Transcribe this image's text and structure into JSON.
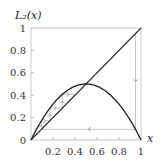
{
  "chart_data": {
    "type": "line",
    "title": "",
    "ylabel": "L2(x)",
    "ylabel_display": "L₂(x)",
    "xlabel": "x",
    "xlim": [
      0,
      1
    ],
    "ylim": [
      0,
      1
    ],
    "grid": false,
    "legend": null,
    "xticks": [
      0.2,
      0.4,
      0.6,
      0.8,
      1
    ],
    "xtick_labels": [
      "0.2",
      "0.4",
      "0.6",
      "0.8",
      "1"
    ],
    "yticks": [
      0,
      0.2,
      0.4,
      0.6,
      0.8,
      1
    ],
    "ytick_labels": [
      "0",
      "0.2",
      "0.4",
      "0.6",
      "0.8",
      "1"
    ],
    "series": [
      {
        "name": "L2(x) = 2x(1-x)",
        "kind": "curve",
        "x": [
          0,
          0.1,
          0.2,
          0.3,
          0.4,
          0.5,
          0.6,
          0.7,
          0.8,
          0.9,
          1.0
        ],
        "y": [
          0,
          0.18,
          0.32,
          0.42,
          0.48,
          0.5,
          0.48,
          0.42,
          0.32,
          0.18,
          0
        ]
      },
      {
        "name": "y = x",
        "kind": "diagonal",
        "x": [
          0,
          1
        ],
        "y": [
          0,
          1
        ]
      }
    ],
    "cobweb": {
      "start_x": 0.95,
      "steps": [
        {
          "from": [
            0.95,
            0.95
          ],
          "to": [
            0.95,
            0.095
          ],
          "arrow": "down"
        },
        {
          "from": [
            0.95,
            0.095
          ],
          "to": [
            0.095,
            0.095
          ],
          "arrow": "left"
        },
        {
          "from": [
            0.095,
            0.095
          ],
          "to": [
            0.095,
            0.172
          ],
          "arrow": "up"
        },
        {
          "from": [
            0.095,
            0.172
          ],
          "to": [
            0.172,
            0.172
          ],
          "arrow": "right"
        },
        {
          "from": [
            0.172,
            0.172
          ],
          "to": [
            0.172,
            0.285
          ],
          "arrow": "up"
        },
        {
          "from": [
            0.172,
            0.285
          ],
          "to": [
            0.285,
            0.285
          ],
          "arrow": "right"
        },
        {
          "from": [
            0.285,
            0.285
          ],
          "to": [
            0.285,
            0.408
          ],
          "arrow": "up"
        },
        {
          "from": [
            0.285,
            0.408
          ],
          "to": [
            0.408,
            0.408
          ],
          "arrow": "right"
        }
      ],
      "fixed_point": [
        0.5,
        0.5
      ]
    }
  },
  "colors": {
    "curve": "#2a2a2a",
    "diagonal": "#3a3a3a",
    "frame": "#bdbdbd",
    "cobweb": "#b0b0b0",
    "text": "#333333"
  }
}
